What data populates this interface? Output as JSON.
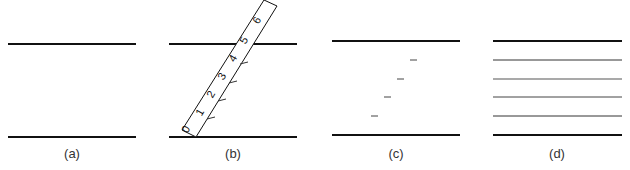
{
  "figure": {
    "panels": [
      {
        "id": "a",
        "caption": "(a)"
      },
      {
        "id": "b",
        "caption": "(b)"
      },
      {
        "id": "c",
        "caption": "(c)"
      },
      {
        "id": "d",
        "caption": "(d)"
      }
    ],
    "ruler": {
      "labels": [
        "0",
        "1",
        "2",
        "3",
        "4",
        "5",
        "6"
      ]
    },
    "colors": {
      "line": "#111111",
      "thin_line": "#333333",
      "text": "#333333"
    }
  }
}
